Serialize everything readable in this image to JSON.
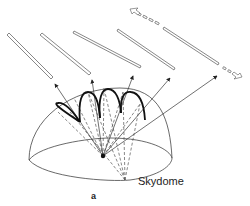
{
  "figure": {
    "panel_label": "a",
    "dome_label": "Skydome",
    "elements": {
      "tubes": 5,
      "moving_tube_indicator": "dashed-double-arrow",
      "center_point": "observer",
      "arcs": "sun-path-loops",
      "rays": "solid-arrows-to-tubes",
      "dashed_lines": "projection-lines"
    },
    "colors": {
      "stroke": "#333333",
      "background": "#ffffff"
    }
  }
}
